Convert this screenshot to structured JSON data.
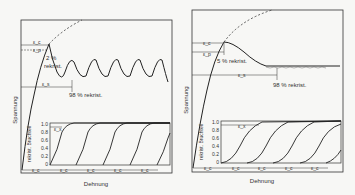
{
  "left_panel": {
    "ylabel": "Spannung",
    "xlabel": "Dehnung",
    "strain_marks": [
      "ε_c",
      "ε_p",
      "ε_s"
    ],
    "annotations": [
      "2 %",
      "rekrist.",
      "98 % rekrist."
    ],
    "inset": {
      "ylabel": "rekrist. Bruchteil",
      "yticks": [
        "1.0",
        "0.8",
        "0.6",
        "0.4",
        "0.2",
        "0"
      ],
      "xmark": "ε_x",
      "interval_marks": [
        "ε_c",
        "ε_c",
        "ε_c",
        "ε_c",
        "ε_c"
      ]
    }
  },
  "right_panel": {
    "ylabel": "Spannung",
    "xlabel": "Dehnung",
    "strain_marks": [
      "ε_c",
      "ε_p",
      "ε_s"
    ],
    "annotations": [
      "5 % rekrist.",
      "98 % rekrist."
    ],
    "inset": {
      "ylabel": "rekrist. Bruchteil",
      "yticks": [
        "1.0",
        "0.8",
        "0.6",
        "0.4",
        "0.2",
        "0"
      ],
      "xmark": "ε_x",
      "interval_marks": [
        "ε_c",
        "ε_c",
        "ε_c",
        "ε_c",
        "ε_c"
      ]
    }
  },
  "glyphs": {
    "eps": "ε"
  }
}
